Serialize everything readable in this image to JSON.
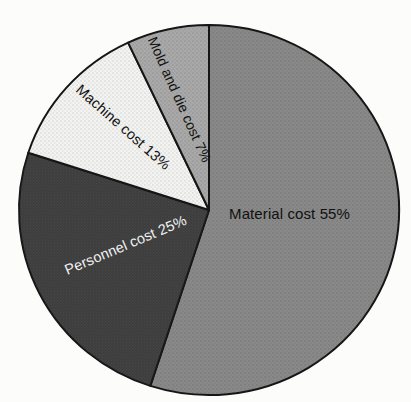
{
  "figure": {
    "background": "#fcfcfb"
  },
  "chart_data": {
    "type": "pie",
    "title": "",
    "categories": [
      "Material cost",
      "Personnel cost",
      "Machine cost",
      "Mold and die cost"
    ],
    "values": [
      55,
      25,
      13,
      7
    ],
    "unit": "%",
    "direction": "clockwise",
    "start_angle_deg": 0,
    "legend_position": "none",
    "outline_color": "#161616",
    "slices": [
      {
        "name": "Material cost",
        "value": 55,
        "label": "Material cost 55%",
        "color": "#898989",
        "label_color": "#111111"
      },
      {
        "name": "Personnel cost",
        "value": 25,
        "label": "Personnel cost 25%",
        "color": "#3c3c3c",
        "label_color": "#f2f2f2"
      },
      {
        "name": "Machine cost",
        "value": 13,
        "label": "Machine cost 13%",
        "color": "#f3f3f1",
        "label_color": "#111111"
      },
      {
        "name": "Mold and die cost",
        "value": 7,
        "label": "Mold and die cost 7%",
        "color": "#a9a9a9",
        "label_color": "#111111"
      }
    ]
  }
}
